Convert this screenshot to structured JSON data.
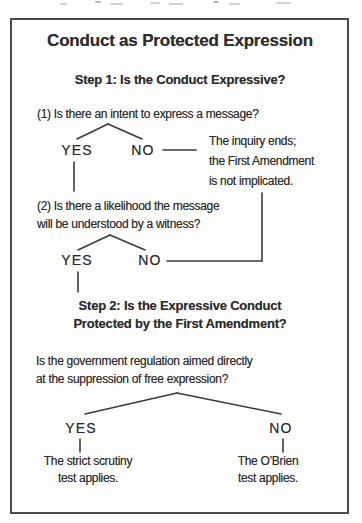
{
  "diagram": {
    "title": "Conduct as Protected Expression",
    "step1": {
      "heading": "Step 1: Is the Conduct Expressive?",
      "question1": "(1) Is there an intent to express a message?",
      "branch1": {
        "yes": "YES",
        "no": "NO"
      },
      "no_outcome": {
        "line1": "The inquiry ends;",
        "line2": "the First Amendment",
        "line3": "is not implicated."
      },
      "question2_line1": "(2) Is there a likelihood the message",
      "question2_line2": "will be understood by a witness?",
      "branch2": {
        "yes": "YES",
        "no": "NO"
      }
    },
    "step2": {
      "heading_line1": "Step 2: Is the Expressive Conduct",
      "heading_line2": "Protected by the First Amendment?",
      "question_line1": "Is the government regulation aimed directly",
      "question_line2": "at the suppression of free expression?",
      "branch": {
        "yes": "YES",
        "no": "NO"
      },
      "yes_outcome_line1": "The strict scrutiny",
      "yes_outcome_line2": "test applies.",
      "no_outcome_line1": "The O’Brien",
      "no_outcome_line2": "test applies."
    },
    "colors": {
      "paper": "#fdfdfc",
      "ink": "#2e2c2a",
      "border": "#4b4a47",
      "line": "#3d3b38"
    }
  }
}
